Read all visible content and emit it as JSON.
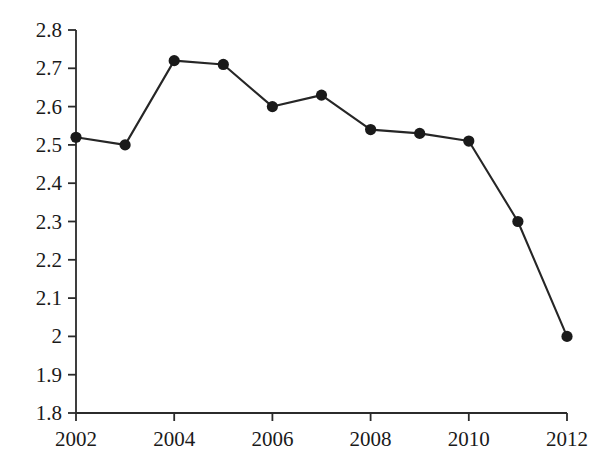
{
  "chart_data": {
    "type": "line",
    "title": "",
    "subtitle": "",
    "xlabel": "",
    "ylabel": "",
    "x": [
      2002,
      2003,
      2004,
      2005,
      2006,
      2007,
      2008,
      2009,
      2010,
      2011,
      2012
    ],
    "values": [
      2.52,
      2.5,
      2.72,
      2.71,
      2.6,
      2.63,
      2.54,
      2.53,
      2.51,
      2.3,
      2.0
    ],
    "series": [
      {
        "name": "",
        "values": [
          2.52,
          2.5,
          2.72,
          2.71,
          2.6,
          2.63,
          2.54,
          2.53,
          2.51,
          2.3,
          2.0
        ]
      }
    ],
    "xlim": [
      2002,
      2012
    ],
    "ylim": [
      1.8,
      2.8
    ],
    "y_ticks": [
      1.8,
      1.9,
      2.0,
      2.1,
      2.2,
      2.3,
      2.4,
      2.5,
      2.6,
      2.7,
      2.8
    ],
    "y_tick_labels": [
      "1.8",
      "1.9",
      "2",
      "2.1",
      "2.2",
      "2.3",
      "2.4",
      "2.5",
      "2.6",
      "2.7",
      "2.8"
    ],
    "x_ticks": [
      2002,
      2004,
      2006,
      2008,
      2010,
      2012
    ],
    "x_tick_labels": [
      "2002",
      "2004",
      "2006",
      "2008",
      "2010",
      "2012"
    ],
    "grid": false,
    "legend": false,
    "legend_position": "none",
    "marker": "circle",
    "colors": {
      "line": "#262626",
      "marker": "#1a1a1a",
      "axis": "#2b2b2b",
      "text": "#1a1a1a",
      "background": "#ffffff"
    }
  }
}
